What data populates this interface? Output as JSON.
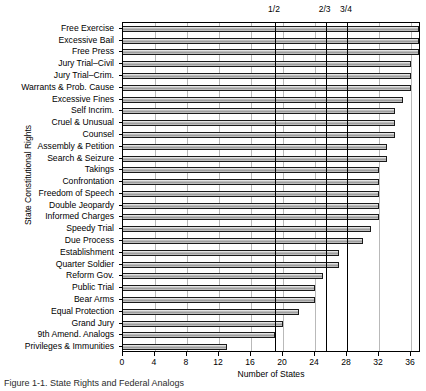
{
  "chart_data": {
    "type": "bar",
    "orientation": "horizontal",
    "title": "",
    "xlabel": "Number of States",
    "ylabel": "State Constitutional Rights",
    "xlim": [
      0,
      37.25
    ],
    "ylim_count": 27,
    "grid": true,
    "legend": null,
    "xticks": [
      0,
      4,
      8,
      12,
      16,
      20,
      24,
      28,
      32,
      36
    ],
    "xticklabels": [
      "0",
      "4",
      "8",
      "12",
      "16",
      "20",
      "24",
      "28",
      "32",
      "36"
    ],
    "categories": [
      "Free Exercise",
      "Excessive Bail",
      "Free Press",
      "Jury Trial–Civil",
      "Jury Trial–Crim.",
      "Warrants & Prob. Cause",
      "Excessive Fines",
      "Self Incrim.",
      "Cruel & Unusual",
      "Counsel",
      "Assembly & Petition",
      "Search & Seizure",
      "Takings",
      "Confrontation",
      "Freedom of Speech",
      "Double Jeopardy",
      "Informed Charges",
      "Speedy Trial",
      "Due Process",
      "Establishment",
      "Quarter Soldier",
      "Reform Gov.",
      "Public Trial",
      "Bear Arms",
      "Equal Protection",
      "Grand Jury",
      "9th Amend. Analogs",
      "Privileges & Immunities"
    ],
    "values": [
      37,
      37,
      37,
      36,
      36,
      36,
      35,
      34,
      34,
      34,
      33,
      33,
      32,
      32,
      32,
      32,
      32,
      31,
      30,
      27,
      27,
      25,
      24,
      24,
      22,
      20,
      19,
      13
    ],
    "annotations": [
      {
        "label": "1/2",
        "value": 19
      },
      {
        "label": "2/3",
        "value": 25.33
      },
      {
        "label": "3/4",
        "value": 28
      }
    ]
  },
  "caption": {
    "text": "Figure 1-1. State Rights and Federal Analogs"
  }
}
